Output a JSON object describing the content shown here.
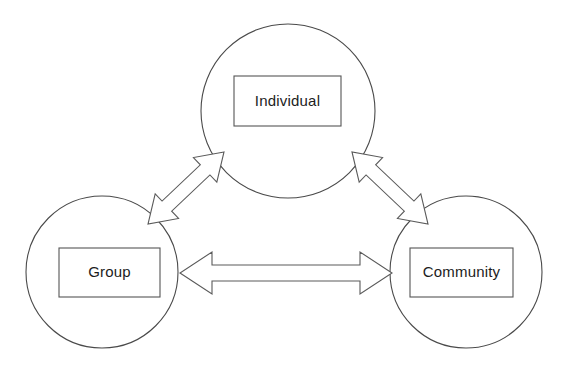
{
  "diagram": {
    "background_color": "#ffffff",
    "stroke_color": "#4a4a4a",
    "label_color": "#1c1c1c",
    "nodes": [
      {
        "id": "individual",
        "label": "Individual",
        "circle": {
          "cx": 288,
          "cy": 111,
          "r": 87
        },
        "box": {
          "x": 234,
          "y": 76,
          "w": 107,
          "h": 50
        }
      },
      {
        "id": "group",
        "label": "Group",
        "circle": {
          "cx": 102,
          "cy": 272,
          "r": 76
        },
        "box": {
          "x": 59,
          "y": 248,
          "w": 101,
          "h": 49
        }
      },
      {
        "id": "community",
        "label": "Community",
        "circle": {
          "cx": 466,
          "cy": 272,
          "r": 76
        },
        "box": {
          "x": 410,
          "y": 248,
          "w": 103,
          "h": 49
        }
      }
    ],
    "connectors": [
      {
        "id": "individual-group",
        "from": "Individual",
        "to": "Group",
        "style": "double-headed-hollow-arrow",
        "orientation": "diagonal-down-left"
      },
      {
        "id": "individual-community",
        "from": "Individual",
        "to": "Community",
        "style": "double-headed-hollow-arrow",
        "orientation": "diagonal-down-right"
      },
      {
        "id": "group-community",
        "from": "Group",
        "to": "Community",
        "style": "double-headed-hollow-arrow",
        "orientation": "horizontal"
      }
    ]
  }
}
